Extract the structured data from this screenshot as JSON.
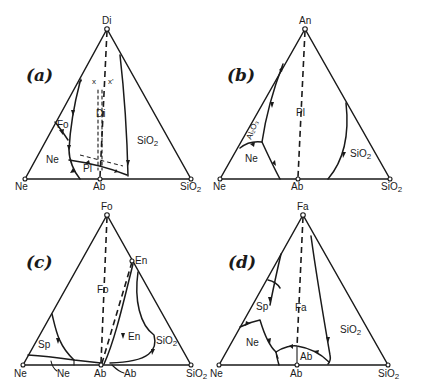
{
  "figure": {
    "panels": [
      {
        "id": "a",
        "label": "(a)",
        "apex": "Di",
        "base_left": "Ne",
        "base_mid": "Ab",
        "base_right": "SiO2",
        "fields": [
          "Fo",
          "Ne",
          "Pl",
          "Di",
          "SiO2"
        ],
        "markers": [
          "x",
          "x'"
        ]
      },
      {
        "id": "b",
        "label": "(b)",
        "apex": "An",
        "base_left": "Ne",
        "base_mid": "Ab",
        "base_right": "SiO2",
        "fields": [
          "Al2O3",
          "Ne",
          "Pl",
          "SiO2"
        ]
      },
      {
        "id": "c",
        "label": "(c)",
        "apex": "Fo",
        "base_left": "Ne",
        "base_mid": "Ab",
        "base_right": "SiO2",
        "side_point": "En",
        "fields": [
          "Sp",
          "Ne",
          "Fo",
          "En",
          "SiO2",
          "Ab"
        ]
      },
      {
        "id": "d",
        "label": "(d)",
        "apex": "Fa",
        "base_left": "Ne",
        "base_mid": "Ab",
        "base_right": "SiO2",
        "fields": [
          "Sp",
          "Ne",
          "Fa",
          "Ab",
          "SiO2"
        ]
      }
    ]
  },
  "text": {
    "a_label": "(a)",
    "a_apex": "Di",
    "a_ne": "Ne",
    "a_ab": "Ab",
    "a_sio2": "SiO",
    "a_sub": "2",
    "a_fo": "Fo",
    "a_field_ne": "Ne",
    "a_pl": "Pl",
    "a_di": "Di",
    "a_field_sio2": "SiO",
    "a_x": "x",
    "a_xp": "x'",
    "b_label": "(b)",
    "b_apex": "An",
    "b_ne": "Ne",
    "b_ab": "Ab",
    "b_sio2": "SiO",
    "b_al2o3": "Al₂O₃",
    "b_field_ne": "Ne",
    "b_pl": "Pl",
    "b_field_sio2": "SiO",
    "c_label": "(c)",
    "c_apex": "Fo",
    "c_en_pt": "En",
    "c_ne": "Ne",
    "c_ab": "Ab",
    "c_sio2": "SiO",
    "c_sp": "Sp",
    "c_field_ne": "Ne",
    "c_fo": "Fo",
    "c_en": "En",
    "c_field_sio2": "SiO",
    "c_field_ab": "Ab",
    "d_label": "(d)",
    "d_apex": "Fa",
    "d_ne": "Ne",
    "d_ab": "Ab",
    "d_sio2": "SiO",
    "d_sp": "Sp",
    "d_field_ne": "Ne",
    "d_fa": "Fa",
    "d_field_ab": "Ab",
    "d_field_sio2": "SiO",
    "sub2": "2"
  },
  "colors": {
    "ink": "#1a1a1a",
    "paper": "#ffffff"
  }
}
